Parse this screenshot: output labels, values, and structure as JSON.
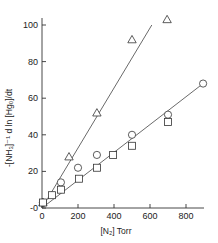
{
  "chart_data": {
    "type": "scatter",
    "title": "",
    "xlabel": "[N₂] Torr",
    "ylabel": "-[NH₃]⁻¹ d ln [Hg₀]/dt",
    "xlim": [
      0,
      900
    ],
    "ylim": [
      0,
      105
    ],
    "x_ticks": [
      0,
      200,
      400,
      600,
      800
    ],
    "y_ticks": [
      0,
      20,
      40,
      60,
      80,
      100
    ],
    "y_tick_labels": [
      "-0",
      "20",
      "40",
      "60",
      "80",
      "100"
    ],
    "grid": false,
    "legend": null,
    "series": [
      {
        "name": "triangles",
        "marker": "triangle",
        "points": [
          [
            5,
            3
          ],
          [
            150,
            28
          ],
          [
            305,
            52
          ],
          [
            500,
            92
          ],
          [
            695,
            103
          ]
        ]
      },
      {
        "name": "circles",
        "marker": "circle",
        "points": [
          [
            5,
            3
          ],
          [
            105,
            14
          ],
          [
            200,
            22
          ],
          [
            305,
            29
          ],
          [
            500,
            40
          ],
          [
            700,
            51
          ],
          [
            895,
            68
          ]
        ]
      },
      {
        "name": "squares",
        "marker": "square",
        "points": [
          [
            5,
            3
          ],
          [
            55,
            7
          ],
          [
            105,
            10
          ],
          [
            205,
            16
          ],
          [
            305,
            22
          ],
          [
            395,
            29
          ],
          [
            500,
            34
          ],
          [
            700,
            47
          ]
        ]
      }
    ],
    "fit_lines": [
      {
        "name": "upper-fit",
        "from": [
          0,
          0
        ],
        "to": [
          610,
          100
        ]
      },
      {
        "name": "lower-fit",
        "from": [
          0,
          0
        ],
        "to": [
          895,
          68
        ]
      }
    ]
  }
}
